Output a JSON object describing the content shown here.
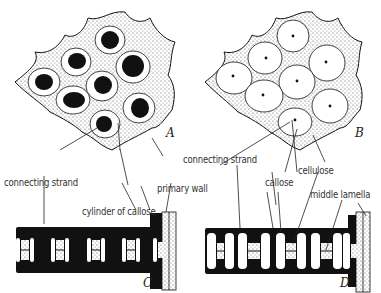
{
  "figure": {
    "panels": [
      {
        "id": "A",
        "label": "A",
        "description": "sieve plate surface view, pores with connecting strands surrounded by callose"
      },
      {
        "id": "B",
        "label": "B",
        "description": "sieve plate surface view, large callose cylinders with small central strands"
      },
      {
        "id": "C",
        "label": "C",
        "description": "sieve plate sectional view, thin callose cylinders"
      },
      {
        "id": "D",
        "label": "D",
        "description": "sieve plate sectional view, thick callose cylinders"
      }
    ],
    "labels": {
      "connecting_strand_left": "connecting strand",
      "cylinder_of_callose": "cylinder of callose",
      "primary_wall": "primary wall",
      "connecting_strand_right": "connecting strand",
      "callose": "callose",
      "cellulose": "cellulose",
      "middle_lamella": "middle lamella"
    },
    "colors": {
      "ink": "#111111",
      "stipple": "#bdbdbd",
      "background": "#ffffff"
    }
  }
}
